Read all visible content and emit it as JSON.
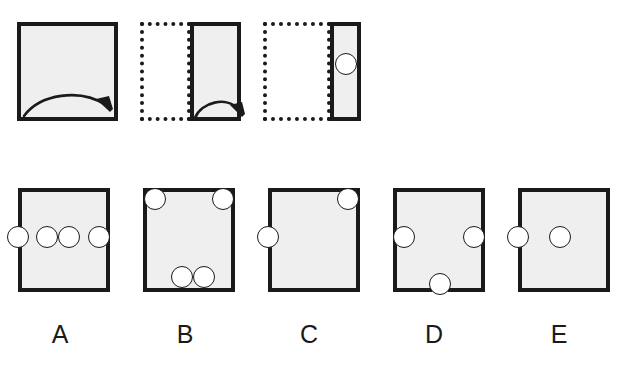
{
  "figure": {
    "type": "paper-folding-punch-puzzle",
    "background_color": "#ffffff",
    "paper_fill_color": "#efefef",
    "line_color": "#1a1a1a",
    "hole_fill_color": "#ffffff"
  },
  "prompt_sequence": {
    "title": "",
    "steps": [
      {
        "id": "step-1",
        "caption": "",
        "solid_shape": {
          "shape": "square",
          "x": 17,
          "y": 22,
          "w": 101,
          "h": 99
        },
        "ghost_shape": null,
        "fold_arrow": {
          "direction": "right",
          "x": 26,
          "y": 84,
          "w": 84,
          "h": 28
        },
        "holes": []
      },
      {
        "id": "step-2",
        "caption": "",
        "solid_shape": {
          "shape": "rectangle",
          "x": 190,
          "y": 22,
          "w": 51,
          "h": 99
        },
        "ghost_shape": {
          "shape": "rectangle",
          "x": 140,
          "y": 22,
          "w": 51,
          "h": 99
        },
        "fold_arrow": {
          "direction": "right",
          "x": 198,
          "y": 95,
          "w": 44,
          "h": 20
        },
        "holes": []
      },
      {
        "id": "step-3",
        "caption": "",
        "solid_shape": {
          "shape": "rectangle",
          "x": 330,
          "y": 22,
          "w": 31,
          "h": 99
        },
        "ghost_shape": {
          "shape": "rectangle",
          "x": 263,
          "y": 22,
          "w": 68,
          "h": 99
        },
        "fold_arrow": null,
        "holes": [
          {
            "id": "punch-1",
            "cx": 346,
            "cy": 64,
            "r": 11
          }
        ]
      }
    ]
  },
  "answer_options": [
    {
      "id": "option-a",
      "label": "A",
      "label_x": 60,
      "label_y": 329,
      "box": {
        "x": 18,
        "y": 188,
        "w": 92,
        "h": 104
      },
      "holes": [
        {
          "cx": 18,
          "cy": 237,
          "r": 11
        },
        {
          "cx": 47,
          "cy": 237,
          "r": 11
        },
        {
          "cx": 69,
          "cy": 237,
          "r": 11
        },
        {
          "cx": 99,
          "cy": 237,
          "r": 11
        }
      ]
    },
    {
      "id": "option-b",
      "label": "B",
      "label_x": 185,
      "label_y": 329,
      "box": {
        "x": 143,
        "y": 188,
        "w": 92,
        "h": 104
      },
      "holes": [
        {
          "cx": 155,
          "cy": 199,
          "r": 11
        },
        {
          "cx": 223,
          "cy": 199,
          "r": 11
        },
        {
          "cx": 182,
          "cy": 277,
          "r": 11
        },
        {
          "cx": 204,
          "cy": 277,
          "r": 11
        }
      ]
    },
    {
      "id": "option-c",
      "label": "C",
      "label_x": 309,
      "label_y": 329,
      "box": {
        "x": 268,
        "y": 188,
        "w": 92,
        "h": 104
      },
      "holes": [
        {
          "cx": 348,
          "cy": 199,
          "r": 11
        },
        {
          "cx": 268,
          "cy": 237,
          "r": 11
        }
      ]
    },
    {
      "id": "option-d",
      "label": "D",
      "label_x": 434,
      "label_y": 329,
      "box": {
        "x": 393,
        "y": 188,
        "w": 92,
        "h": 104
      },
      "holes": [
        {
          "cx": 404,
          "cy": 237,
          "r": 11
        },
        {
          "cx": 474,
          "cy": 237,
          "r": 11
        },
        {
          "cx": 440,
          "cy": 284,
          "r": 11
        }
      ]
    },
    {
      "id": "option-e",
      "label": "E",
      "label_x": 559,
      "label_y": 329,
      "box": {
        "x": 518,
        "y": 188,
        "w": 92,
        "h": 104
      },
      "holes": [
        {
          "cx": 518,
          "cy": 237,
          "r": 11
        },
        {
          "cx": 560,
          "cy": 237,
          "r": 11
        }
      ]
    }
  ]
}
